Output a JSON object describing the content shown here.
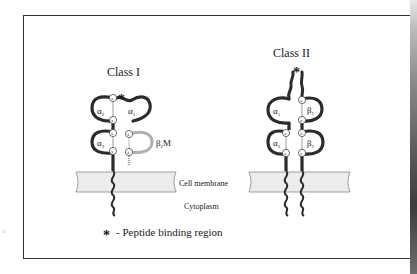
{
  "figure": {
    "title_class1": "Class I",
    "title_class2": "Class II",
    "class1_domains": {
      "alpha1": "α",
      "alpha1_sub": "1",
      "alpha2": "α",
      "alpha2_sub": "2",
      "alpha3": "α",
      "alpha3_sub": "3",
      "b2m": "β",
      "b2m_sub": "2",
      "b2m_suffix": "M"
    },
    "class2_domains": {
      "alpha1": "α",
      "alpha1_sub": "1",
      "alpha2": "α",
      "alpha2_sub": "2",
      "beta1": "β",
      "beta1_sub": "1",
      "beta2": "β",
      "beta2_sub": "2"
    },
    "disulfide_label": "s",
    "asterisk": "*",
    "membrane_label": "Cell membrane",
    "cytoplasm_label": "Cytoplasm",
    "legend": {
      "symbol": "*",
      "text": "- Peptide binding region"
    },
    "stray_mark": "c"
  },
  "colors": {
    "chain": "#2b2b2b",
    "b2m_chain": "#b0b0b0",
    "membrane_fill": "#ececec",
    "membrane_stroke": "#8c8c8c",
    "frame": "#333333",
    "text": "#1a1a1a"
  }
}
